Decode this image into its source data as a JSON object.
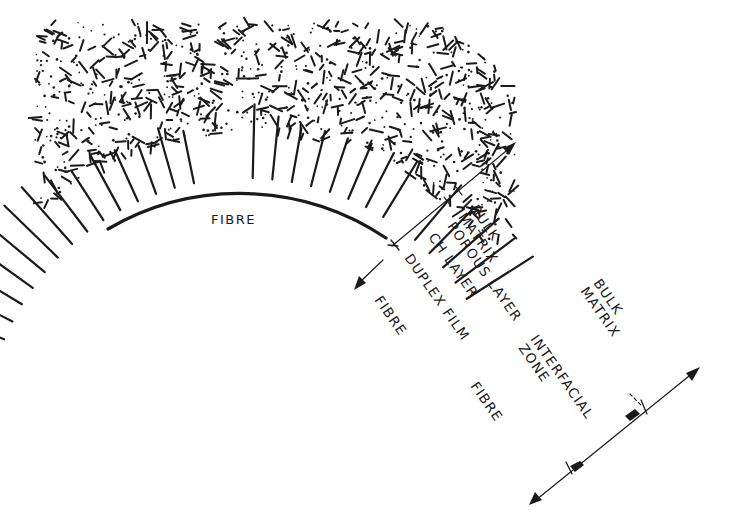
{
  "diagram": {
    "type": "fibre-matrix interfacial zone schematic",
    "ink_color": "#1a1a1a",
    "background": "#ffffff",
    "fibre_label": "FIBRE",
    "inner_axis": {
      "labels": {
        "bulk_matrix_line1": "BULK",
        "bulk_matrix_line2": "MATRIX",
        "porous_layer": "POROUS LAYER",
        "ch_layer": "CH LAYER",
        "duplex_film": "DUPLEX FILM",
        "fibre": "FIBRE"
      }
    },
    "outer_scale": {
      "labels": {
        "bulk_matrix_line1": "BULK",
        "bulk_matrix_line2": "MATRIX",
        "interfacial_zone_line1": "INTERFACIAL",
        "interfacial_zone_line2": "ZONE",
        "fibre": "FIBRE"
      }
    },
    "regions": [
      {
        "name": "Fibre",
        "texture": "blank"
      },
      {
        "name": "Duplex film",
        "texture": "thin line"
      },
      {
        "name": "CH layer",
        "texture": "radial oriented crystals"
      },
      {
        "name": "Porous layer",
        "texture": "loose random needles"
      },
      {
        "name": "Bulk matrix",
        "texture": "dense random needles and dots"
      }
    ]
  }
}
